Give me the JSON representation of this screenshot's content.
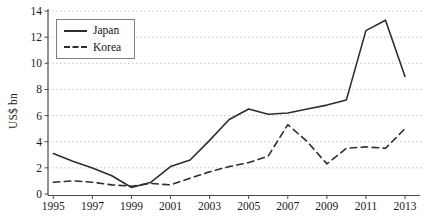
{
  "chart_data": {
    "type": "line",
    "title": "",
    "xlabel": "",
    "ylabel": "US$ bn",
    "x": [
      1995,
      1996,
      1997,
      1998,
      1999,
      2000,
      2001,
      2002,
      2003,
      2004,
      2005,
      2006,
      2007,
      2008,
      2009,
      2010,
      2011,
      2012,
      2013
    ],
    "series": [
      {
        "name": "Japan",
        "style": "solid",
        "color": "#2e2e2e",
        "values": [
          3.1,
          2.5,
          2.0,
          1.4,
          0.5,
          0.9,
          2.1,
          2.6,
          4.1,
          5.7,
          6.5,
          6.1,
          6.2,
          6.5,
          6.8,
          7.2,
          12.5,
          13.3,
          9.0
        ]
      },
      {
        "name": "Korea",
        "style": "dashed",
        "color": "#2e2e2e",
        "values": [
          0.9,
          1.0,
          0.9,
          0.7,
          0.6,
          0.8,
          0.7,
          1.2,
          1.7,
          2.1,
          2.4,
          2.9,
          5.3,
          4.0,
          2.3,
          3.5,
          3.6,
          3.5,
          5.0
        ]
      }
    ],
    "ylim": [
      0,
      14
    ],
    "ytick_step": 2,
    "ytick_labels": [
      "0",
      "2",
      "4",
      "6",
      "8",
      "10",
      "12",
      "14"
    ],
    "xtick_labels": [
      "1995",
      "1997",
      "1999",
      "2001",
      "2003",
      "2005",
      "2007",
      "2009",
      "2011",
      "2013"
    ],
    "legend_position": "top-left",
    "grid": "dotted-horizontal",
    "grid_color": "#c6c6c6",
    "axis_color": "#4a4a4a",
    "text_color": "#1a1a1a",
    "background": "#ffffff"
  }
}
